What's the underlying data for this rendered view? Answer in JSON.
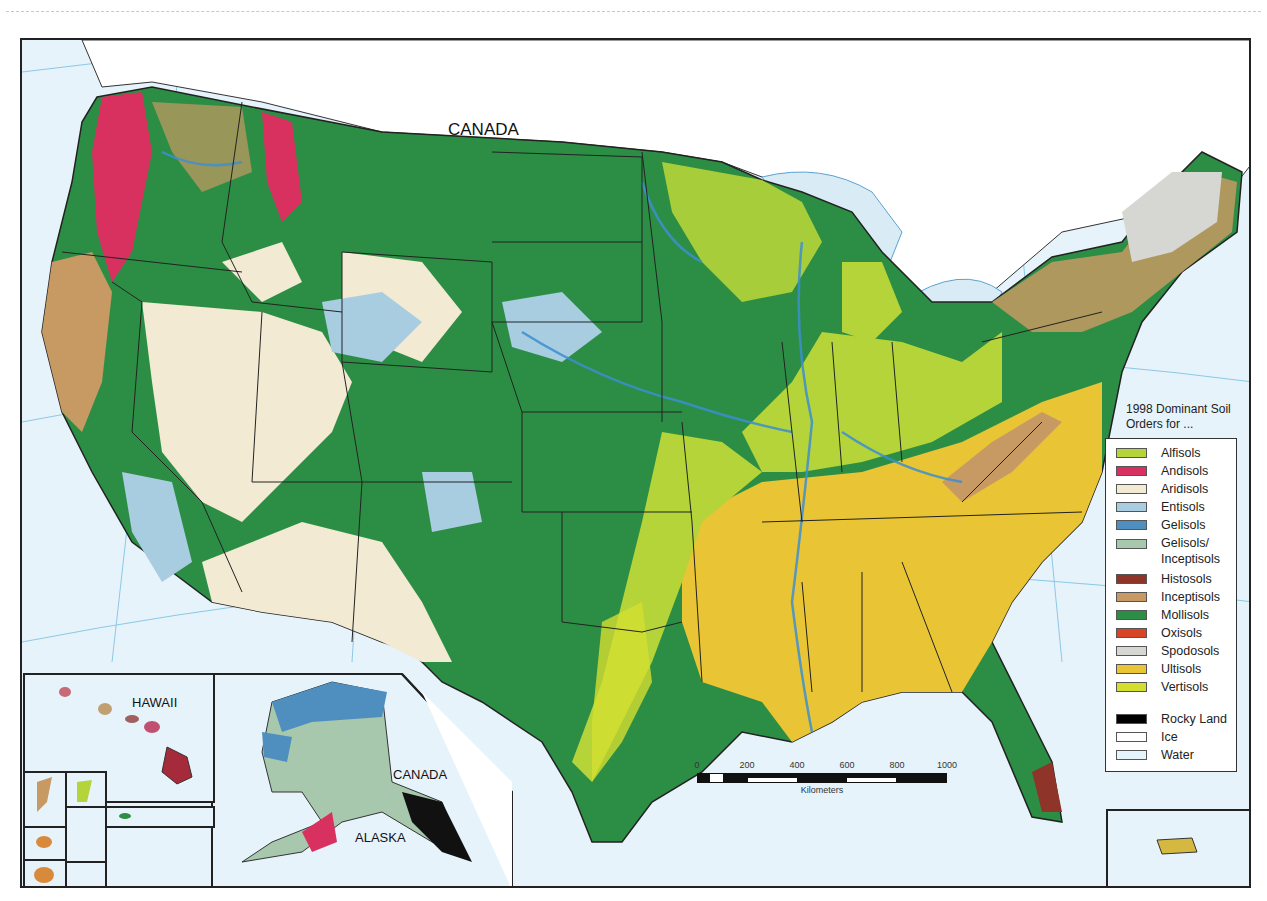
{
  "map": {
    "title_labels": {
      "canada_main": "CANADA",
      "hawaii": "HAWAII",
      "alaska": "ALASKA",
      "canada_inset": "CANADA"
    },
    "legend": {
      "title": "1998 Dominant Soil Orders for ...",
      "items": [
        {
          "label": "Alfisols",
          "color": "#b5d43a"
        },
        {
          "label": "Andisols",
          "color": "#d8315f"
        },
        {
          "label": "Aridisols",
          "color": "#f2ead3"
        },
        {
          "label": "Entisols",
          "color": "#a9cde0"
        },
        {
          "label": "Gelisols",
          "color": "#4f8fbf"
        },
        {
          "label": "Gelisols/ Inceptisols",
          "color": "#a8c8ae"
        },
        {
          "label": "Histosols",
          "color": "#8e3428"
        },
        {
          "label": "Inceptisols",
          "color": "#c79a63"
        },
        {
          "label": "Mollisols",
          "color": "#2c8e45"
        },
        {
          "label": "Oxisols",
          "color": "#d94425"
        },
        {
          "label": "Spodosols",
          "color": "#d6d6d2"
        },
        {
          "label": "Ultisols",
          "color": "#e9c535"
        },
        {
          "label": "Vertisols",
          "color": "#d4de2f"
        }
      ],
      "extra_items": [
        {
          "label": "Rocky Land",
          "color": "#000000"
        },
        {
          "label": "Ice",
          "color": "#ffffff"
        },
        {
          "label": "Water",
          "color": "#e6f3fa"
        }
      ]
    },
    "scale_bar": {
      "ticks": [
        "0",
        "200",
        "400",
        "600",
        "800",
        "1000"
      ],
      "unit": "Kilometers"
    },
    "colors": {
      "ocean": "#e6f3fa",
      "canada_land": "#ffffff",
      "border": "#222222",
      "graticule": "#7fbfe0"
    }
  }
}
